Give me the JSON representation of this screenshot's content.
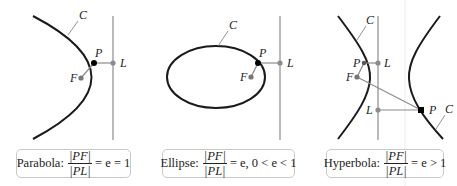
{
  "colors": {
    "curve": "#1a1a1a",
    "directrix": "#8c8c8c",
    "segment": "#8c8c8c",
    "point_focus": "#777777",
    "point_on_curve": "#000000",
    "caption_border": "#c9c9c9"
  },
  "panels": [
    {
      "name": "parabola",
      "labels": {
        "curve": "C",
        "point": "P",
        "focus": "F",
        "directrix_point": "L"
      },
      "caption": {
        "name": "Parabola:",
        "numerator": "|PF|",
        "denominator": "|PL|",
        "relation": "= e = 1"
      }
    },
    {
      "name": "ellipse",
      "labels": {
        "curve": "C",
        "point": "P",
        "focus": "F",
        "directrix_point": "L"
      },
      "caption": {
        "name": "Ellipse:",
        "numerator": "|PF|",
        "denominator": "|PL|",
        "relation": "= e, 0 < e < 1"
      }
    },
    {
      "name": "hyperbola",
      "labels": {
        "curve_left": "C",
        "curve_right": "C",
        "point_upper": "P",
        "point_lower": "P",
        "focus": "F",
        "directrix_point_upper": "L",
        "directrix_point_lower": "L"
      },
      "caption": {
        "name": "Hyperbola:",
        "numerator": "|PF|",
        "denominator": "|PL|",
        "relation": "= e > 1"
      }
    }
  ]
}
